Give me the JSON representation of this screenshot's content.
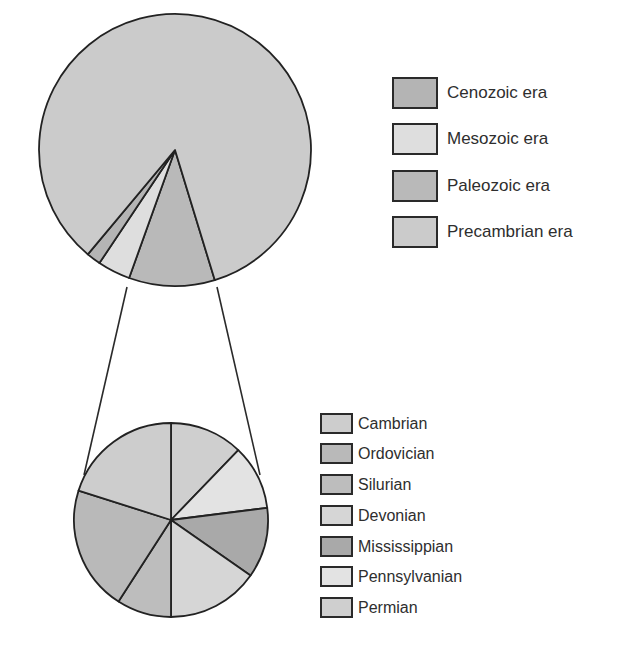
{
  "chart_data": [
    {
      "type": "pie",
      "title": "",
      "description": "Geologic eras as proportion of Earth's history",
      "start_angle_deg": 163,
      "direction": "clockwise",
      "categories": [
        "Paleozoic era",
        "Mesozoic era",
        "Cenozoic era",
        "Precambrian era"
      ],
      "values": [
        10.2,
        3.9,
        1.7,
        84.2
      ],
      "unit": "percent (estimated from slice angles)",
      "legend": [
        "Cenozoic era",
        "Mesozoic era",
        "Paleozoic era",
        "Precambrian era"
      ],
      "legend_position": "right"
    },
    {
      "type": "pie",
      "title": "",
      "description": "Exploded view of Paleozoic era periods",
      "start_angle_deg": 0,
      "direction": "clockwise",
      "categories": [
        "Permian",
        "Pennsylvanian",
        "Mississippian",
        "Devonian",
        "Silurian",
        "Ordovician",
        "Cambrian"
      ],
      "values": [
        12.2,
        10.8,
        11.7,
        15.3,
        9.1,
        20.8,
        20.1
      ],
      "unit": "percent (estimated from slice angles)",
      "legend": [
        "Cambrian",
        "Ordovician",
        "Silurian",
        "Devonian",
        "Mississippian",
        "Pennsylvanian",
        "Permian"
      ],
      "legend_position": "right"
    }
  ],
  "colors": {
    "Cenozoic era": "#b4b4b4",
    "Mesozoic era": "#dedede",
    "Paleozoic era": "#b9b9b9",
    "Precambrian era": "#cbcbcb",
    "Cambrian": "#cdcdcd",
    "Ordovician": "#b9b9b9",
    "Silurian": "#bdbdbd",
    "Devonian": "#d6d6d6",
    "Mississippian": "#a9a9a9",
    "Pennsylvanian": "#e3e3e3",
    "Permian": "#cfcfcf"
  },
  "legend_top": {
    "items": [
      {
        "label": "Cenozoic era"
      },
      {
        "label": "Mesozoic era"
      },
      {
        "label": "Paleozoic era"
      },
      {
        "label": "Precambrian era"
      }
    ]
  },
  "legend_bottom": {
    "items": [
      {
        "label": "Cambrian"
      },
      {
        "label": "Ordovician"
      },
      {
        "label": "Silurian"
      },
      {
        "label": "Devonian"
      },
      {
        "label": "Mississippian"
      },
      {
        "label": "Pennsylvanian"
      },
      {
        "label": "Permian"
      }
    ]
  }
}
